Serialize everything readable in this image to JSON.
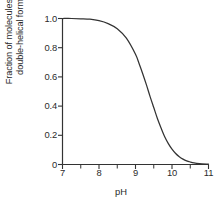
{
  "figure": {
    "background_color": "#ffffff",
    "line_color": "#333333",
    "text_color": "#2b2b2b"
  },
  "chart_data": {
    "type": "line",
    "title": "",
    "subtitle": "",
    "xlabel": "pH",
    "ylabel": "Fraction of molecules in double-helical form",
    "ylabel_line1": "Fraction of molecules in",
    "ylabel_line2": "double-helical form",
    "xlim": [
      7,
      11
    ],
    "ylim": [
      0,
      1.0
    ],
    "grid": false,
    "legend": "none",
    "xticks": [
      7,
      8,
      9,
      10,
      11
    ],
    "xticklabels": [
      "7",
      "8",
      "9",
      "10",
      "11"
    ],
    "xminorticks": [
      7.5,
      8.5,
      9.5,
      10.5
    ],
    "yticks": [
      0,
      0.2,
      0.4,
      0.6,
      0.8,
      1.0
    ],
    "yticklabels": [
      "0",
      "0.2",
      "0.4",
      "0.6",
      "0.8",
      "1.0"
    ],
    "series": [
      {
        "name": "Fraction double-helical",
        "color": "#333333",
        "x": [
          7.0,
          7.25,
          7.5,
          7.75,
          8.0,
          8.25,
          8.5,
          8.75,
          9.0,
          9.1,
          9.2,
          9.3,
          9.4,
          9.5,
          9.6,
          9.7,
          9.8,
          9.9,
          10.0,
          10.1,
          10.2,
          10.3,
          10.4,
          10.5,
          10.6,
          10.75,
          11.0
        ],
        "y": [
          1.0,
          1.0,
          0.998,
          0.995,
          0.985,
          0.965,
          0.93,
          0.865,
          0.755,
          0.69,
          0.62,
          0.545,
          0.465,
          0.39,
          0.315,
          0.25,
          0.19,
          0.143,
          0.105,
          0.075,
          0.053,
          0.037,
          0.025,
          0.017,
          0.011,
          0.006,
          0.002
        ]
      }
    ]
  },
  "axes": {
    "x_axis_name": "pH axis",
    "y_axis_name": "fraction double-helical axis"
  }
}
